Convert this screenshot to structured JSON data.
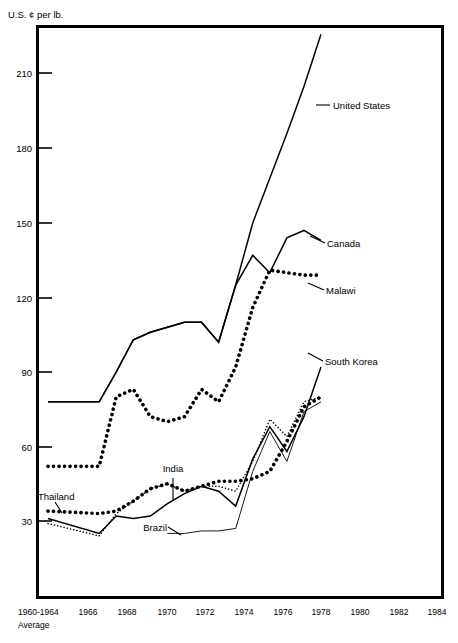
{
  "chart_data": {
    "type": "line",
    "title": "",
    "ylabel": "U.S. ¢ per lb.",
    "xlabel": "",
    "ylim": [
      0,
      240
    ],
    "yticks": [
      30,
      60,
      90,
      120,
      150,
      180,
      210
    ],
    "grid": false,
    "legend_position": "inline-right",
    "x_axis_label_top": "1960-1964",
    "x_axis_label_bottom": "Average",
    "xtick_labels": [
      "1960-1964",
      "1966",
      "1968",
      "1970",
      "1972",
      "1974",
      "1976",
      "1978",
      "1980",
      "1982",
      "1984"
    ],
    "x": [
      1962,
      1965,
      1966,
      1967,
      1968,
      1969,
      1970,
      1971,
      1972,
      1973,
      1974,
      1975,
      1976,
      1977,
      1978
    ],
    "series": [
      {
        "name": "United States",
        "style": "solid-thick",
        "x": [
          1962,
          1965,
          1966,
          1967,
          1968,
          1969,
          1970,
          1971,
          1972,
          1973,
          1974,
          1975,
          1976,
          1977,
          1978
        ],
        "values": [
          78,
          78,
          90,
          103,
          106,
          108,
          110,
          110,
          102,
          125,
          150,
          168,
          186,
          205,
          226
        ]
      },
      {
        "name": "Canada",
        "style": "solid-thick",
        "x": [
          1962,
          1965,
          1966,
          1967,
          1968,
          1969,
          1970,
          1971,
          1972,
          1973,
          1974,
          1975,
          1976,
          1977,
          1978
        ],
        "values": [
          78,
          78,
          90,
          103,
          106,
          108,
          110,
          110,
          102,
          125,
          137,
          130,
          144,
          147,
          143
        ]
      },
      {
        "name": "Malawi",
        "style": "dotted-thick",
        "x": [
          1962,
          1965,
          1966,
          1967,
          1968,
          1969,
          1970,
          1971,
          1972,
          1973,
          1974,
          1975,
          1976,
          1977,
          1978
        ],
        "values": [
          52,
          52,
          80,
          83,
          72,
          70,
          72,
          83,
          78,
          92,
          116,
          131,
          130,
          129,
          129
        ]
      },
      {
        "name": "South Korea",
        "style": "solid-thick",
        "x": [
          1962,
          1965,
          1966,
          1967,
          1968,
          1969,
          1970,
          1971,
          1972,
          1973,
          1974,
          1975,
          1976,
          1977,
          1978
        ],
        "values": [
          31,
          25,
          32,
          31,
          32,
          37,
          41,
          44,
          42,
          36,
          55,
          68,
          58,
          72,
          92
        ]
      },
      {
        "name": "India",
        "style": "dotted-thick",
        "x": [
          1962,
          1965,
          1966,
          1967,
          1968,
          1969,
          1970,
          1971,
          1972,
          1973,
          1974,
          1975,
          1976,
          1977,
          1978
        ],
        "values": [
          34,
          33,
          34,
          38,
          43,
          45,
          42,
          44,
          46,
          46,
          47,
          50,
          62,
          76,
          80
        ]
      },
      {
        "name": "Thailand",
        "style": "dotted-thin",
        "x": [
          1962,
          1965,
          1966,
          1967,
          1968,
          1969,
          1970,
          1971,
          1972,
          1973,
          1974,
          1975,
          1976,
          1977,
          1978
        ],
        "values": [
          29,
          24,
          33,
          38,
          43,
          45,
          42,
          44,
          44,
          42,
          54,
          71,
          64,
          78,
          80
        ]
      },
      {
        "name": "Brazil",
        "style": "solid-thin",
        "x": [
          1969,
          1970,
          1971,
          1972,
          1973,
          1974,
          1975,
          1976,
          1977,
          1978
        ],
        "values": [
          25,
          25,
          26,
          26,
          27,
          50,
          66,
          54,
          74,
          78
        ]
      }
    ],
    "annotations": [
      {
        "label": "United States",
        "x": 333,
        "y": 109
      },
      {
        "label": "Canada",
        "x": 327,
        "y": 244
      },
      {
        "label": "Malawi",
        "x": 327,
        "y": 290
      },
      {
        "label": "South Korea",
        "x": 325,
        "y": 364
      },
      {
        "label": "Thailand",
        "x": 40,
        "y": 497
      },
      {
        "label": "India",
        "x": 158,
        "y": 473
      },
      {
        "label": "Brazil",
        "x": 140,
        "y": 525
      }
    ]
  }
}
